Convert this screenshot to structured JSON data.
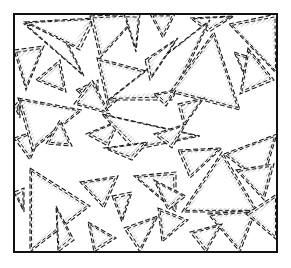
{
  "illustration": {
    "description": "Overlapping dashed-outline triangles with hatched shading inside a square frame",
    "frame": {
      "x": 14,
      "y": 14,
      "width": 263,
      "height": 238,
      "stroke": "#111111"
    },
    "colors": {
      "line": "#1a1a1a",
      "hatch": "#9a9a9a",
      "background": "#ffffff"
    },
    "triangles": [
      {
        "points": [
          [
            24,
            24
          ],
          [
            56,
            20
          ],
          [
            84,
            76
          ]
        ],
        "shade": "right"
      },
      {
        "points": [
          [
            25,
            22
          ],
          [
            95,
            18
          ],
          [
            80,
            50
          ]
        ],
        "shade": "top"
      },
      {
        "points": [
          [
            90,
            16
          ],
          [
            140,
            14
          ],
          [
            100,
            58
          ]
        ],
        "shade": "left"
      },
      {
        "points": [
          [
            124,
            14
          ],
          [
            140,
            14
          ],
          [
            136,
            52
          ]
        ],
        "shade": "right"
      },
      {
        "points": [
          [
            150,
            14
          ],
          [
            175,
            14
          ],
          [
            163,
            38
          ]
        ],
        "shade": "right"
      },
      {
        "points": [
          [
            190,
            18
          ],
          [
            234,
            16
          ],
          [
            209,
            32
          ]
        ],
        "shade": "top"
      },
      {
        "points": [
          [
            229,
            24
          ],
          [
            277,
            14
          ],
          [
            277,
            74
          ]
        ],
        "shade": "bottom"
      },
      {
        "points": [
          [
            14,
            50
          ],
          [
            44,
            46
          ],
          [
            26,
            90
          ]
        ],
        "shade": "left"
      },
      {
        "points": [
          [
            36,
            80
          ],
          [
            60,
            60
          ],
          [
            66,
            92
          ]
        ],
        "shade": "left"
      },
      {
        "points": [
          [
            76,
            90
          ],
          [
            98,
            80
          ],
          [
            98,
            108
          ]
        ],
        "shade": "right"
      },
      {
        "points": [
          [
            97,
            58
          ],
          [
            150,
            72
          ],
          [
            108,
            108
          ]
        ],
        "shade": "bottom"
      },
      {
        "points": [
          [
            108,
            100
          ],
          [
            210,
            20
          ],
          [
            172,
            100
          ]
        ],
        "shade": "top"
      },
      {
        "points": [
          [
            145,
            60
          ],
          [
            178,
            38
          ],
          [
            150,
            80
          ]
        ],
        "shade": "right"
      },
      {
        "points": [
          [
            170,
            92
          ],
          [
            214,
            32
          ],
          [
            240,
            110
          ]
        ],
        "shade": "left"
      },
      {
        "points": [
          [
            234,
            52
          ],
          [
            260,
            60
          ],
          [
            250,
            88
          ]
        ],
        "shade": "top"
      },
      {
        "points": [
          [
            248,
            48
          ],
          [
            274,
            80
          ],
          [
            240,
            94
          ]
        ],
        "shade": "left"
      },
      {
        "points": [
          [
            14,
            138
          ],
          [
            44,
            128
          ],
          [
            30,
            160
          ]
        ],
        "shade": "left"
      },
      {
        "points": [
          [
            18,
            98
          ],
          [
            82,
            110
          ],
          [
            32,
            150
          ]
        ],
        "shade": "bottom"
      },
      {
        "points": [
          [
            46,
            144
          ],
          [
            60,
            120
          ],
          [
            72,
            146
          ]
        ],
        "shade": "right"
      },
      {
        "points": [
          [
            74,
            104
          ],
          [
            92,
            80
          ],
          [
            110,
            114
          ]
        ],
        "shade": "left"
      },
      {
        "points": [
          [
            86,
            134
          ],
          [
            120,
            120
          ],
          [
            108,
            146
          ]
        ],
        "shade": "top"
      },
      {
        "points": [
          [
            102,
            114
          ],
          [
            200,
            136
          ],
          [
            134,
            150
          ]
        ],
        "shade": "top"
      },
      {
        "points": [
          [
            154,
            94
          ],
          [
            176,
            90
          ],
          [
            166,
            106
          ]
        ],
        "shade": "right"
      },
      {
        "points": [
          [
            178,
            104
          ],
          [
            204,
            98
          ],
          [
            184,
            126
          ]
        ],
        "shade": "top"
      },
      {
        "points": [
          [
            154,
            134
          ],
          [
            186,
            124
          ],
          [
            172,
            148
          ]
        ],
        "shade": "right"
      },
      {
        "points": [
          [
            178,
            150
          ],
          [
            222,
            148
          ],
          [
            190,
            178
          ]
        ],
        "shade": "right"
      },
      {
        "points": [
          [
            224,
            154
          ],
          [
            277,
            134
          ],
          [
            262,
            184
          ]
        ],
        "shade": "left"
      },
      {
        "points": [
          [
            236,
            170
          ],
          [
            274,
            164
          ],
          [
            264,
            200
          ]
        ],
        "shade": "left"
      },
      {
        "points": [
          [
            30,
            168
          ],
          [
            90,
            206
          ],
          [
            30,
            252
          ]
        ],
        "shade": "left"
      },
      {
        "points": [
          [
            14,
            192
          ],
          [
            24,
            188
          ],
          [
            24,
            212
          ]
        ],
        "shade": "left"
      },
      {
        "points": [
          [
            80,
            182
          ],
          [
            118,
            176
          ],
          [
            104,
            208
          ]
        ],
        "shade": "bottom"
      },
      {
        "points": [
          [
            104,
            148
          ],
          [
            148,
            142
          ],
          [
            132,
            160
          ]
        ],
        "shade": "top"
      },
      {
        "points": [
          [
            134,
            176
          ],
          [
            176,
            172
          ],
          [
            176,
            212
          ]
        ],
        "shade": "top"
      },
      {
        "points": [
          [
            154,
            180
          ],
          [
            186,
            196
          ],
          [
            168,
            210
          ]
        ],
        "shade": "right"
      },
      {
        "points": [
          [
            182,
            212
          ],
          [
            222,
            152
          ],
          [
            258,
            212
          ]
        ],
        "shade": "bottom"
      },
      {
        "points": [
          [
            208,
            214
          ],
          [
            256,
            210
          ],
          [
            240,
            252
          ]
        ],
        "shade": "left"
      },
      {
        "points": [
          [
            56,
            206
          ],
          [
            74,
            240
          ],
          [
            58,
            252
          ]
        ],
        "shade": "right"
      },
      {
        "points": [
          [
            88,
            222
          ],
          [
            116,
            238
          ],
          [
            94,
            252
          ]
        ],
        "shade": "right"
      },
      {
        "points": [
          [
            112,
            196
          ],
          [
            132,
            192
          ],
          [
            122,
            222
          ]
        ],
        "shade": "left"
      },
      {
        "points": [
          [
            124,
            228
          ],
          [
            158,
            216
          ],
          [
            140,
            252
          ]
        ],
        "shade": "left"
      },
      {
        "points": [
          [
            158,
            208
          ],
          [
            188,
            220
          ],
          [
            162,
            242
          ]
        ],
        "shade": "right"
      },
      {
        "points": [
          [
            190,
            232
          ],
          [
            222,
            224
          ],
          [
            206,
            252
          ]
        ],
        "shade": "left"
      },
      {
        "points": [
          [
            246,
            214
          ],
          [
            277,
            194
          ],
          [
            277,
            240
          ]
        ],
        "shade": "left"
      },
      {
        "points": [
          [
            14,
            106
          ],
          [
            20,
            100
          ],
          [
            20,
            118
          ]
        ],
        "shade": "left"
      }
    ]
  }
}
